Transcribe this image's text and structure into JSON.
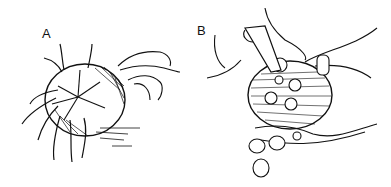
{
  "figure": {
    "panels": [
      {
        "label": "A",
        "description": "Spiny sea urchin held by fingers, viewed from the mouth side with a star-shaped cut pattern"
      },
      {
        "label": "B",
        "description": "Opened urchin held in hand; roe lobes being scooped out and dropped into palm"
      }
    ],
    "colors": {
      "ink": "#111111",
      "background": "#ffffff"
    }
  }
}
